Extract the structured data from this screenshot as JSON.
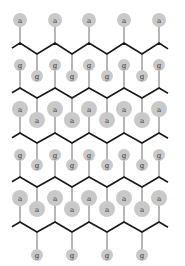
{
  "diagram": {
    "type": "polymer-brush-schematic",
    "colors": {
      "background": "#ffffff",
      "chain": "#1a1a1a",
      "stem": "#7a7a7a",
      "bead": "#c9c9c9",
      "label": "#333333"
    },
    "chain_x": {
      "start": 12,
      "end": 168,
      "peaks": [
        20,
        55,
        89,
        124,
        159
      ],
      "valleys": [
        37,
        72,
        107,
        142
      ]
    },
    "chains": [
      {
        "peak_y": 43,
        "valley_y": 54
      },
      {
        "peak_y": 88,
        "valley_y": 98
      },
      {
        "peak_y": 133,
        "valley_y": 143
      },
      {
        "peak_y": 177,
        "valley_y": 187
      },
      {
        "peak_y": 222,
        "valley_y": 232
      }
    ],
    "beads": [
      {
        "label": "a",
        "x": 20,
        "y": 20,
        "r": 7,
        "attach": [
          20,
          43
        ]
      },
      {
        "label": "a",
        "x": 55,
        "y": 20,
        "r": 7,
        "attach": [
          55,
          43
        ]
      },
      {
        "label": "a",
        "x": 89,
        "y": 20,
        "r": 7,
        "attach": [
          89,
          43
        ]
      },
      {
        "label": "a",
        "x": 124,
        "y": 20,
        "r": 7,
        "attach": [
          124,
          43
        ]
      },
      {
        "label": "a",
        "x": 159,
        "y": 20,
        "r": 7,
        "attach": [
          159,
          43
        ]
      },
      {
        "label": "g",
        "x": 20,
        "y": 65,
        "r": 6,
        "attach": [
          20,
          88
        ]
      },
      {
        "label": "g",
        "x": 55,
        "y": 65,
        "r": 6,
        "attach": [
          55,
          88
        ]
      },
      {
        "label": "g",
        "x": 89,
        "y": 65,
        "r": 6,
        "attach": [
          89,
          88
        ]
      },
      {
        "label": "g",
        "x": 124,
        "y": 65,
        "r": 6,
        "attach": [
          124,
          88
        ]
      },
      {
        "label": "g",
        "x": 159,
        "y": 65,
        "r": 6,
        "attach": [
          159,
          88
        ]
      },
      {
        "label": "g",
        "x": 37,
        "y": 76,
        "r": 6,
        "attach": [
          37,
          54
        ]
      },
      {
        "label": "g",
        "x": 72,
        "y": 76,
        "r": 6,
        "attach": [
          72,
          54
        ]
      },
      {
        "label": "g",
        "x": 107,
        "y": 76,
        "r": 6,
        "attach": [
          107,
          54
        ]
      },
      {
        "label": "g",
        "x": 142,
        "y": 76,
        "r": 6,
        "attach": [
          142,
          54
        ]
      },
      {
        "label": "a",
        "x": 20,
        "y": 109,
        "r": 8,
        "attach": [
          20,
          133
        ]
      },
      {
        "label": "a",
        "x": 55,
        "y": 109,
        "r": 8,
        "attach": [
          55,
          133
        ]
      },
      {
        "label": "a",
        "x": 89,
        "y": 109,
        "r": 8,
        "attach": [
          89,
          133
        ]
      },
      {
        "label": "a",
        "x": 124,
        "y": 109,
        "r": 8,
        "attach": [
          124,
          133
        ]
      },
      {
        "label": "a",
        "x": 159,
        "y": 109,
        "r": 8,
        "attach": [
          159,
          133
        ]
      },
      {
        "label": "a",
        "x": 37,
        "y": 120,
        "r": 8,
        "attach": [
          37,
          98
        ]
      },
      {
        "label": "a",
        "x": 72,
        "y": 120,
        "r": 8,
        "attach": [
          72,
          98
        ]
      },
      {
        "label": "a",
        "x": 107,
        "y": 120,
        "r": 8,
        "attach": [
          107,
          98
        ]
      },
      {
        "label": "a",
        "x": 142,
        "y": 120,
        "r": 8,
        "attach": [
          142,
          98
        ]
      },
      {
        "label": "g",
        "x": 20,
        "y": 155,
        "r": 6,
        "attach": [
          20,
          177
        ]
      },
      {
        "label": "g",
        "x": 55,
        "y": 155,
        "r": 6,
        "attach": [
          55,
          177
        ]
      },
      {
        "label": "g",
        "x": 89,
        "y": 155,
        "r": 6,
        "attach": [
          89,
          177
        ]
      },
      {
        "label": "g",
        "x": 124,
        "y": 155,
        "r": 6,
        "attach": [
          124,
          177
        ]
      },
      {
        "label": "g",
        "x": 159,
        "y": 155,
        "r": 6,
        "attach": [
          159,
          177
        ]
      },
      {
        "label": "g",
        "x": 37,
        "y": 165,
        "r": 6,
        "attach": [
          37,
          143
        ]
      },
      {
        "label": "g",
        "x": 72,
        "y": 165,
        "r": 6,
        "attach": [
          72,
          143
        ]
      },
      {
        "label": "g",
        "x": 107,
        "y": 165,
        "r": 6,
        "attach": [
          107,
          143
        ]
      },
      {
        "label": "g",
        "x": 142,
        "y": 165,
        "r": 6,
        "attach": [
          142,
          143
        ]
      },
      {
        "label": "a",
        "x": 20,
        "y": 198,
        "r": 8,
        "attach": [
          20,
          222
        ]
      },
      {
        "label": "a",
        "x": 55,
        "y": 198,
        "r": 8,
        "attach": [
          55,
          222
        ]
      },
      {
        "label": "a",
        "x": 89,
        "y": 198,
        "r": 8,
        "attach": [
          89,
          222
        ]
      },
      {
        "label": "a",
        "x": 124,
        "y": 198,
        "r": 8,
        "attach": [
          124,
          222
        ]
      },
      {
        "label": "a",
        "x": 159,
        "y": 198,
        "r": 8,
        "attach": [
          159,
          222
        ]
      },
      {
        "label": "a",
        "x": 37,
        "y": 209,
        "r": 8,
        "attach": [
          37,
          187
        ]
      },
      {
        "label": "a",
        "x": 72,
        "y": 209,
        "r": 8,
        "attach": [
          72,
          187
        ]
      },
      {
        "label": "a",
        "x": 107,
        "y": 209,
        "r": 8,
        "attach": [
          107,
          187
        ]
      },
      {
        "label": "a",
        "x": 142,
        "y": 209,
        "r": 8,
        "attach": [
          142,
          187
        ]
      },
      {
        "label": "g",
        "x": 37,
        "y": 255,
        "r": 6,
        "attach": [
          37,
          232
        ]
      },
      {
        "label": "g",
        "x": 72,
        "y": 255,
        "r": 6,
        "attach": [
          72,
          232
        ]
      },
      {
        "label": "g",
        "x": 107,
        "y": 255,
        "r": 6,
        "attach": [
          107,
          232
        ]
      },
      {
        "label": "g",
        "x": 142,
        "y": 255,
        "r": 6,
        "attach": [
          142,
          232
        ]
      }
    ]
  }
}
